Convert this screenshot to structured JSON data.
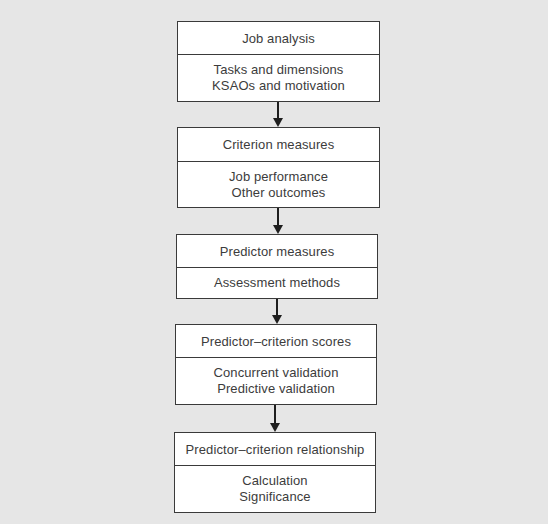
{
  "diagram": {
    "type": "flowchart",
    "direction": "top-to-bottom",
    "background_color": "#e6e6e6",
    "box_fill": "#ffffff",
    "border_color": "#3a3a3a",
    "text_color": "#3c3c3c",
    "steps": [
      {
        "title": "Job analysis",
        "lines": [
          "Tasks and dimensions",
          "KSAOs and motivation"
        ]
      },
      {
        "title": "Criterion measures",
        "lines": [
          "Job performance",
          "Other outcomes"
        ]
      },
      {
        "title": "Predictor measures",
        "lines": [
          "Assessment methods"
        ]
      },
      {
        "title": "Predictor–criterion scores",
        "lines": [
          "Concurrent validation",
          "Predictive validation"
        ]
      },
      {
        "title": "Predictor–criterion relationship",
        "lines": [
          "Calculation",
          "Significance"
        ]
      }
    ],
    "connectors": [
      {
        "from": 0,
        "to": 1,
        "icon": "arrow-down-icon"
      },
      {
        "from": 1,
        "to": 2,
        "icon": "arrow-down-icon"
      },
      {
        "from": 2,
        "to": 3,
        "icon": "arrow-down-icon"
      },
      {
        "from": 3,
        "to": 4,
        "icon": "arrow-down-icon"
      }
    ]
  }
}
